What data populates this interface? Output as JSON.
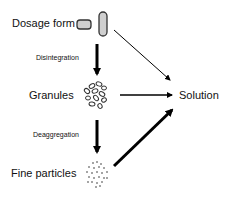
{
  "diagram": {
    "nodes": {
      "dosage_form": "Dosage form",
      "granules": "Granules",
      "fine_particles": "Fine particles",
      "solution": "Solution"
    },
    "edges": {
      "disintegration": "Disintegration",
      "deaggregation": "Deaggregation"
    },
    "colors": {
      "arrow": "#000000",
      "tablet_fill": "#cfcfcf",
      "text": "#111111"
    }
  }
}
